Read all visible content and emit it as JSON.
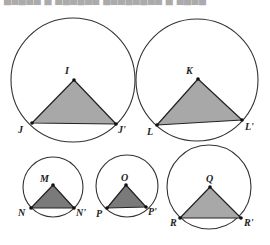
{
  "figure": {
    "top_strip_text": "▇▆▇▅▆ ▇ ▆▇▆▇▅▆ ▇▆▅▇▆▇▅▆ ▇ ▆▇▆▇",
    "colors": {
      "stroke": "#333333",
      "fill_light": "#a8a8a8",
      "fill_dark": "#7a7a7a",
      "background": "#ffffff"
    },
    "circles": [
      {
        "id": "I",
        "center": [
          73,
          80
        ],
        "r": 62,
        "apex": {
          "label": "I",
          "pt": [
            74,
            80
          ],
          "label_pos": [
            65,
            74
          ]
        },
        "left": {
          "label": "J",
          "pt": [
            32,
            123
          ],
          "label_pos": [
            18,
            133
          ]
        },
        "right": {
          "label": "J'",
          "pt": [
            116,
            124
          ],
          "label_pos": [
            118,
            133
          ]
        },
        "fill": "light"
      },
      {
        "id": "K",
        "center": [
          197,
          80
        ],
        "r": 61,
        "apex": {
          "label": "K",
          "pt": [
            198,
            79
          ],
          "label_pos": [
            186,
            74
          ]
        },
        "left": {
          "label": "L",
          "pt": [
            157,
            125
          ],
          "label_pos": [
            147,
            135
          ]
        },
        "right": {
          "label": "L'",
          "pt": [
            242,
            120
          ],
          "label_pos": [
            245,
            130
          ]
        },
        "fill": "light"
      },
      {
        "id": "M",
        "center": [
          53,
          187
        ],
        "r": 30,
        "apex": {
          "label": "M",
          "pt": [
            53,
            185
          ],
          "label_pos": [
            40,
            182
          ]
        },
        "left": {
          "label": "N",
          "pt": [
            31,
            208
          ],
          "label_pos": [
            18,
            216
          ]
        },
        "right": {
          "label": "N'",
          "pt": [
            74,
            208
          ],
          "label_pos": [
            76,
            216
          ]
        },
        "fill": "dark"
      },
      {
        "id": "O",
        "center": [
          127,
          186
        ],
        "r": 31,
        "apex": {
          "label": "O",
          "pt": [
            126,
            185
          ],
          "label_pos": [
            121,
            181
          ]
        },
        "left": {
          "label": "P",
          "pt": [
            107,
            208
          ],
          "label_pos": [
            96,
            217
          ]
        },
        "right": {
          "label": "P'",
          "pt": [
            146,
            207
          ],
          "label_pos": [
            148,
            215
          ]
        },
        "fill": "dark"
      },
      {
        "id": "Q",
        "center": [
          209,
          187
        ],
        "r": 42,
        "apex": {
          "label": "Q",
          "pt": [
            210,
            187
          ],
          "label_pos": [
            206,
            182
          ]
        },
        "left": {
          "label": "R",
          "pt": [
            180,
            218
          ],
          "label_pos": [
            170,
            226
          ]
        },
        "right": {
          "label": "R'",
          "pt": [
            241,
            218
          ],
          "label_pos": [
            244,
            226
          ]
        },
        "fill": "light"
      }
    ]
  }
}
